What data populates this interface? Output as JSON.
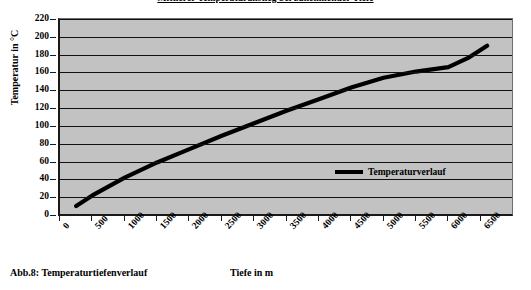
{
  "figure": {
    "caption": "Abb.8: Temperaturtiefenverlauf"
  },
  "chart_data": {
    "type": "line",
    "title": "Mittlerer Temperaturanstieg bei zunehmender Tiefe",
    "xlabel": "Tiefe in m",
    "ylabel": "Temperatur in °C",
    "xlim": [
      0,
      7000
    ],
    "ylim": [
      0,
      220
    ],
    "grid": "horizontal",
    "plot_background": "#c2c2c2",
    "line_color": "#000000",
    "legend_position": "inside-right",
    "xticks": [
      0,
      500,
      1000,
      1500,
      2000,
      2500,
      3000,
      3500,
      4000,
      4500,
      5000,
      5500,
      6000,
      6500
    ],
    "xtick_labels": [
      "0",
      "500",
      "1000",
      "1500",
      "2000",
      "2500",
      "3000",
      "3500",
      "4000",
      "4500",
      "5000",
      "5500",
      "6000",
      "6500"
    ],
    "yticks": [
      0,
      20,
      40,
      60,
      80,
      100,
      120,
      140,
      160,
      180,
      200,
      220
    ],
    "ytick_labels": [
      "0",
      "20",
      "40",
      "60",
      "80",
      "100",
      "120",
      "140",
      "160",
      "180",
      "200",
      "220"
    ],
    "series": [
      {
        "name": "Temperaturverlauf",
        "x": [
          250,
          500,
          1000,
          1500,
          2000,
          2500,
          3000,
          3500,
          4000,
          4500,
          5000,
          5500,
          6000,
          6300,
          6600
        ],
        "values": [
          10,
          22,
          42,
          59,
          74,
          89,
          103,
          117,
          130,
          143,
          154,
          161,
          166,
          176,
          190
        ]
      }
    ]
  }
}
